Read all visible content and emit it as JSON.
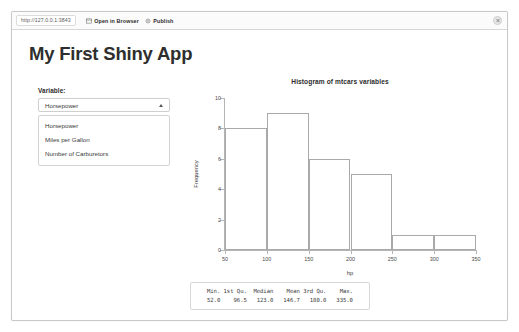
{
  "window": {
    "close_icon": "close-icon"
  },
  "toolbar": {
    "url": "http://127.0.0.1:3843",
    "open_in_browser_label": "Open in Browser",
    "open_in_browser_icon": "browser-window-icon",
    "publish_label": "Publish",
    "publish_icon": "publish-icon"
  },
  "page": {
    "title": "My First Shiny App"
  },
  "sidebar": {
    "variable_label": "Variable:",
    "select": {
      "value": "Horsepower",
      "caret_icon": "chevron-up-icon",
      "options": [
        "Horsepower",
        "Miles per Gallon",
        "Number of Carburetors"
      ]
    }
  },
  "chart_data": {
    "type": "bar",
    "title": "Histogram of mtcars variables",
    "xlabel": "hp",
    "ylabel": "Frequency",
    "xlim": [
      50,
      350
    ],
    "ylim": [
      0,
      10
    ],
    "xticks": [
      50,
      100,
      150,
      200,
      250,
      300,
      350
    ],
    "yticks": [
      0,
      2,
      4,
      6,
      8,
      10
    ],
    "grid": false,
    "legend": null,
    "bin_edges": [
      50,
      100,
      150,
      200,
      250,
      300,
      350
    ],
    "categories": [
      "50-100",
      "100-150",
      "150-200",
      "200-250",
      "250-300",
      "300-350"
    ],
    "values": [
      8,
      9,
      6,
      5,
      1,
      1
    ]
  },
  "summary": {
    "headers": [
      "Min.",
      "1st Qu.",
      "Median",
      "Mean",
      "3rd Qu.",
      "Max."
    ],
    "values": [
      "52.0",
      "96.5",
      "123.0",
      "146.7",
      "180.0",
      "335.0"
    ],
    "text": "   Min. 1st Qu.  Median    Mean 3rd Qu.    Max. \n   52.0    96.5   123.0   146.7   180.0   335.0 "
  }
}
